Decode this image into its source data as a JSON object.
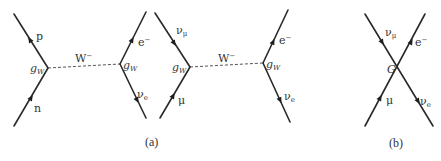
{
  "figure": {
    "panels": [
      {
        "id": "a",
        "caption": "(a)",
        "diagrams": [
          {
            "name": "beta-decay",
            "left_vertex": {
              "coupling": "g",
              "coupling_sub": "W"
            },
            "right_vertex": {
              "coupling": "g",
              "coupling_sub": "W"
            },
            "propagator": {
              "label": "W",
              "label_sup": "−",
              "style": "dashed"
            },
            "legs": {
              "top_left": {
                "particle": "p",
                "sub": ""
              },
              "bottom_left": {
                "particle": "n",
                "sub": ""
              },
              "top_right": {
                "particle": "e",
                "sup": "−"
              },
              "bottom_right": {
                "particle": "ν",
                "sub": "e"
              }
            }
          },
          {
            "name": "muon-decay-w-exchange",
            "left_vertex": {
              "coupling": "g",
              "coupling_sub": "W"
            },
            "right_vertex": {
              "coupling": "g",
              "coupling_sub": "W"
            },
            "propagator": {
              "label": "W",
              "label_sup": "−",
              "style": "dashed"
            },
            "legs": {
              "top_left": {
                "particle": "ν",
                "sub": "μ"
              },
              "bottom_left": {
                "particle": "μ",
                "sub": ""
              },
              "top_right": {
                "particle": "e",
                "sup": "−"
              },
              "bottom_right": {
                "particle": "ν",
                "sub": "e"
              }
            }
          }
        ]
      },
      {
        "id": "b",
        "caption": "(b)",
        "diagrams": [
          {
            "name": "fermi-contact-interaction",
            "vertex": {
              "coupling": "G"
            },
            "legs": {
              "top_left": {
                "particle": "ν",
                "sub": "μ"
              },
              "bottom_left": {
                "particle": "μ",
                "sub": ""
              },
              "top_right": {
                "particle": "e",
                "sup": "−"
              },
              "bottom_right": {
                "particle": "ν",
                "sub": "e"
              }
            }
          }
        ]
      }
    ]
  }
}
